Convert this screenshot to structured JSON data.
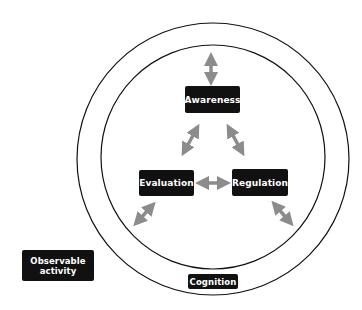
{
  "diagram": {
    "nodes": {
      "awareness": "Awareness",
      "evaluation": "Evaluation",
      "regulation": "Regulation",
      "cognition": "Cognition",
      "observable_line1": "Observable",
      "observable_line2": "activity"
    },
    "edges": [
      {
        "from": "Awareness",
        "to": "outer-ring",
        "type": "bidirectional"
      },
      {
        "from": "Awareness",
        "to": "Evaluation",
        "type": "bidirectional"
      },
      {
        "from": "Awareness",
        "to": "Regulation",
        "type": "bidirectional"
      },
      {
        "from": "Evaluation",
        "to": "Regulation",
        "type": "bidirectional"
      },
      {
        "from": "Evaluation",
        "to": "outer-ring",
        "type": "bidirectional"
      },
      {
        "from": "Regulation",
        "to": "outer-ring",
        "type": "bidirectional"
      }
    ],
    "colors": {
      "box_fill": "#111111",
      "box_text": "#ffffff",
      "arrow": "#8c8c8c",
      "circle_stroke": "#111111"
    }
  }
}
